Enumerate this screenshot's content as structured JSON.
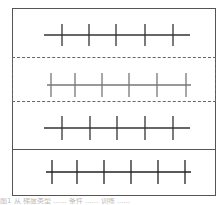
{
  "diagram": {
    "panels": [
      {
        "id": 1,
        "border": "solid",
        "line": {
          "x1": 44,
          "x2": 190,
          "y": 35
        },
        "ticks_x": [
          62,
          89,
          116,
          145,
          173
        ],
        "tick_half": 11,
        "color": "#333333"
      },
      {
        "id": 2,
        "border": "dashed",
        "line": {
          "x1": 47,
          "x2": 191,
          "y": 85
        },
        "ticks_x": [
          51,
          75,
          102,
          129,
          157,
          186
        ],
        "tick_half": 12,
        "color": "#777777"
      },
      {
        "id": 3,
        "border": "solid",
        "line": {
          "x1": 44,
          "x2": 190,
          "y": 128
        },
        "ticks_x": [
          62,
          90,
          117,
          145,
          173
        ],
        "tick_half": 12,
        "color": "#333333"
      },
      {
        "id": 4,
        "border": "solid",
        "line": {
          "x1": 46,
          "x2": 191,
          "y": 172
        },
        "ticks_x": [
          52,
          77,
          104,
          131,
          158,
          185
        ],
        "tick_half": 12,
        "color": "#222222"
      }
    ],
    "caption": "图1 从 梯度类型 ...... 条件 ...... 训练 ......"
  }
}
